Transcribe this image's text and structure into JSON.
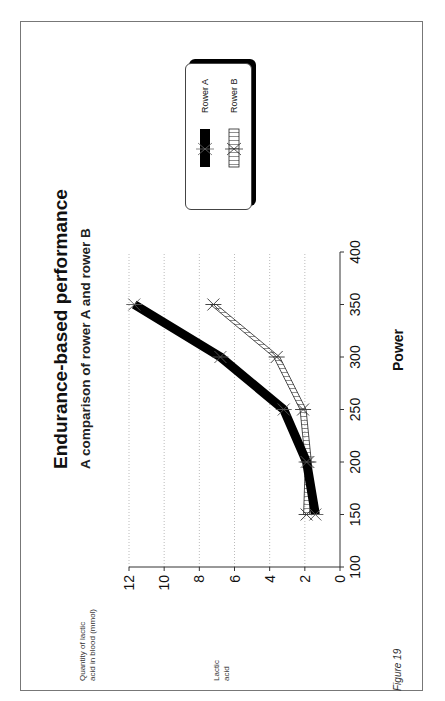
{
  "chart": {
    "title": "Endurance-based performance",
    "subtitle": "A comparison of rower A and rower B",
    "ylabel_line1": "Quantity of lactic",
    "ylabel_line2": "acid in blood (mmol)",
    "ylabel_short_line1": "Lactic",
    "ylabel_short_line2": "acid",
    "xlabel": "Power",
    "figure_caption": "Figure 19",
    "legend": {
      "rower_a": "Rower A",
      "rower_b": "Rower B"
    },
    "xticks": [
      "100",
      "150",
      "200",
      "250",
      "300",
      "350",
      "400"
    ],
    "yticks": [
      "0",
      "2",
      "4",
      "6",
      "8",
      "10",
      "12"
    ]
  },
  "chart_data": {
    "type": "line",
    "title": "Endurance-based performance",
    "subtitle": "A comparison of rower A and rower B",
    "xlabel": "Power",
    "ylabel": "Quantity of lactic acid in blood (mmol)",
    "x": [
      150,
      200,
      250,
      300,
      350
    ],
    "series": [
      {
        "name": "Rower A",
        "values": [
          1.4,
          1.9,
          3.2,
          6.8,
          11.7
        ],
        "style": "thick solid black with star markers"
      },
      {
        "name": "Rower B",
        "values": [
          1.9,
          1.8,
          2.1,
          3.6,
          7.2
        ],
        "style": "hatched band with star markers"
      }
    ],
    "xlim": [
      100,
      400
    ],
    "ylim": [
      0,
      12
    ],
    "x_ticks": [
      100,
      150,
      200,
      250,
      300,
      350,
      400
    ],
    "y_ticks": [
      0,
      2,
      4,
      6,
      8,
      10,
      12
    ],
    "grid": "horizontal dotted",
    "legend_position": "right",
    "orientation": "page rotated 90 degrees counter-clockwise",
    "caption": "Figure 19"
  },
  "colors": {
    "rower_a": "#000000",
    "rower_b_hatch": "#333333",
    "grid": "#aaaaaa",
    "frame": "#777777"
  }
}
